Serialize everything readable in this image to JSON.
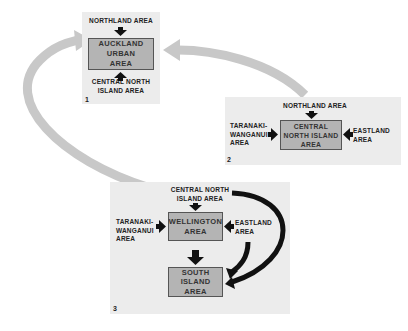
{
  "diagram": {
    "panels": [
      {
        "number": "1",
        "center": "AUCKLAND URBAN AREA",
        "center_lines": [
          "AUCKLAND",
          "URBAN",
          "AREA"
        ],
        "inputs": {
          "top": "NORTHLAND AREA",
          "bottom_lines": [
            "CENTRAL NORTH",
            "ISLAND AREA"
          ]
        }
      },
      {
        "number": "2",
        "center": "CENTRAL NORTH ISLAND AREA",
        "center_lines": [
          "CENTRAL",
          "NORTH ISLAND",
          "AREA"
        ],
        "inputs": {
          "top": "NORTHLAND AREA",
          "left_lines": [
            "TARANAKI-",
            "WANGANUI",
            "AREA"
          ],
          "right_lines": [
            "EASTLAND",
            "AREA"
          ]
        }
      },
      {
        "number": "3",
        "center": "WELLINGTON AREA",
        "center_lines": [
          "WELLINGTON",
          "AREA"
        ],
        "inputs": {
          "top_lines": [
            "CENTRAL NORTH",
            "ISLAND AREA"
          ],
          "left_lines": [
            "TARANAKI-",
            "WANGANUI",
            "AREA"
          ],
          "right_lines": [
            "EASTLAND",
            "AREA"
          ]
        },
        "output": {
          "center_lines": [
            "SOUTH",
            "ISLAND",
            "AREA"
          ]
        }
      }
    ],
    "connectors": [
      {
        "from": "panel-3",
        "to": "panel-1",
        "style": "gray-curved-arrow"
      },
      {
        "from": "panel-2",
        "to": "panel-1",
        "style": "gray-curved-arrow"
      }
    ],
    "colors": {
      "panel_bg": "#ececec",
      "box_fill": "#b4b4b4",
      "connector": "#c8c8c8",
      "arrow": "#111111"
    }
  }
}
